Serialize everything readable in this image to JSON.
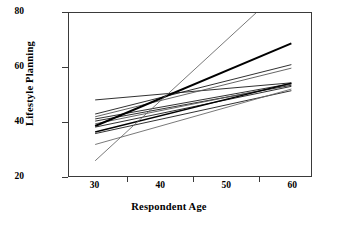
{
  "chart_data": {
    "type": "line",
    "title": "",
    "subtitle": "",
    "xlabel": "Respondent Age",
    "ylabel": "Lifestyle Planning",
    "xlim": [
      26,
      63
    ],
    "ylim": [
      20,
      80
    ],
    "x_major_ticks": [
      30,
      40,
      50,
      60
    ],
    "x_minor_ticks": [
      35,
      45,
      55
    ],
    "y_major_ticks": [
      20,
      40,
      60,
      80
    ],
    "x_tick_labels": [
      "30",
      "40",
      "50",
      "60"
    ],
    "y_tick_labels": [
      "20",
      "40",
      "60",
      "80"
    ],
    "grid": false,
    "legend": null,
    "legend_position": "none",
    "annotations": [],
    "x": [
      30,
      60
    ],
    "series": [
      {
        "name": "line-1",
        "values": [
          48.0,
          54.3
        ],
        "width": 0.9,
        "color": "#1a1a1a"
      },
      {
        "name": "line-2",
        "values": [
          42.8,
          61.0
        ],
        "width": 0.9,
        "color": "#1a1a1a"
      },
      {
        "name": "line-3",
        "values": [
          41.8,
          59.7
        ],
        "width": 0.9,
        "color": "#555555"
      },
      {
        "name": "line-4",
        "values": [
          41.0,
          54.0
        ],
        "width": 0.9,
        "color": "#1a1a1a"
      },
      {
        "name": "line-5",
        "values": [
          40.2,
          53.4
        ],
        "width": 0.9,
        "color": "#1a1a1a"
      },
      {
        "name": "line-6",
        "values": [
          39.2,
          53.8
        ],
        "width": 0.9,
        "color": "#555555"
      },
      {
        "name": "line-7",
        "values": [
          38.4,
          68.8
        ],
        "width": 2.0,
        "color": "#000000"
      },
      {
        "name": "line-8",
        "values": [
          38.0,
          53.0
        ],
        "width": 0.9,
        "color": "#1a1a1a"
      },
      {
        "name": "line-9",
        "values": [
          36.2,
          54.2
        ],
        "width": 1.4,
        "color": "#000000"
      },
      {
        "name": "line-10",
        "values": [
          35.6,
          51.4
        ],
        "width": 0.9,
        "color": "#1a1a1a"
      },
      {
        "name": "line-11",
        "values": [
          31.6,
          52.0
        ],
        "width": 0.9,
        "color": "#6a6a6a"
      },
      {
        "name": "line-12",
        "values": [
          25.6,
          92.0
        ],
        "width": 0.9,
        "color": "#6a6a6a",
        "clipped_top": true
      }
    ]
  }
}
